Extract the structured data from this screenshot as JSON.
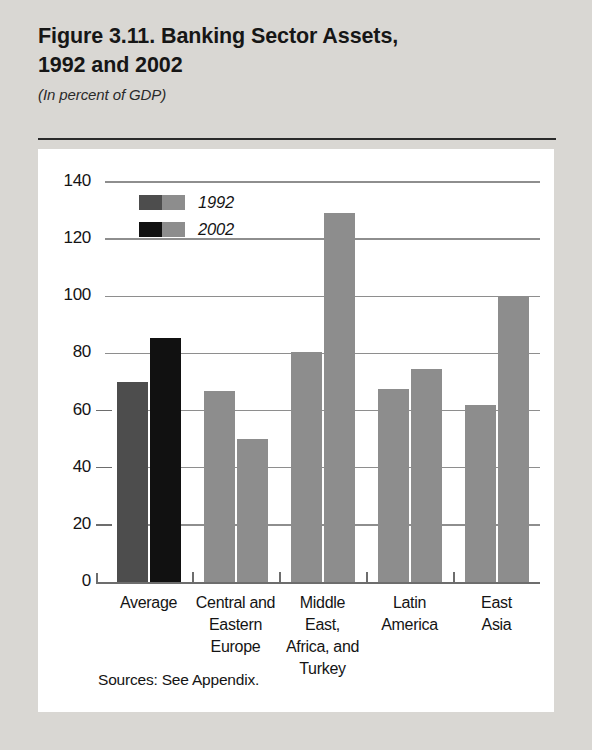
{
  "header": {
    "title": "Figure 3.11. Banking Sector Assets,\n1992 and 2002",
    "subtitle": "(In percent of GDP)"
  },
  "source_note": "Sources: See Appendix.",
  "colors": {
    "page_background": "#d9d7d3",
    "panel_background": "#ffffff",
    "series_1992_average": "#4d4d4d",
    "series_2002_average": "#111111",
    "series_region": "#8d8d8d",
    "gridline": "#8e8e8e",
    "text": "#141414"
  },
  "chart_data": {
    "type": "bar",
    "title": "Figure 3.11. Banking Sector Assets, 1992 and 2002",
    "subtitle": "(In percent of GDP)",
    "xlabel": "",
    "ylabel": "",
    "ylim": [
      0,
      140
    ],
    "yticks": [
      0,
      20,
      40,
      60,
      80,
      100,
      120,
      140
    ],
    "ytick_labels": [
      "0",
      "20",
      "40",
      "60",
      "80",
      "100",
      "120",
      "140"
    ],
    "grid": true,
    "legend_position": "upper-left-inside",
    "categories": [
      "Average",
      "Central and\nEastern\nEurope",
      "Middle\nEast,\nAfrica, and\nTurkey",
      "Latin\nAmerica",
      "East\nAsia"
    ],
    "series": [
      {
        "name": "1992",
        "values": [
          70,
          67,
          80.5,
          67.5,
          62
        ]
      },
      {
        "name": "2002",
        "values": [
          85.5,
          50,
          129,
          74.5,
          100
        ]
      }
    ]
  },
  "legend": {
    "items": [
      {
        "label": "1992",
        "swatch_left": "#4d4d4d",
        "swatch_right": "#8d8d8d"
      },
      {
        "label": "2002",
        "swatch_left": "#111111",
        "swatch_right": "#8d8d8d"
      }
    ]
  }
}
